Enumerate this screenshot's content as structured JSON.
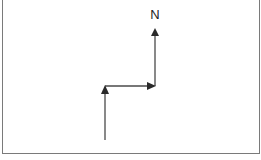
{
  "diagram": {
    "north_label": "N",
    "line_color": "#4a4a4a",
    "border_color": "#7a7a7a",
    "segments": [
      {
        "from": [
          105,
          140
        ],
        "to": [
          105,
          86
        ],
        "arrow": "up"
      },
      {
        "from": [
          105,
          86
        ],
        "to": [
          155,
          86
        ],
        "arrow": "right"
      },
      {
        "from": [
          155,
          86
        ],
        "to": [
          155,
          28
        ],
        "arrow": "up"
      }
    ]
  }
}
